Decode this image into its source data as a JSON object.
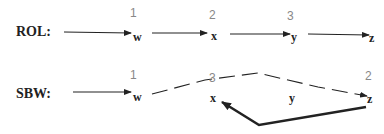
{
  "rows": [
    {
      "label": "ROL:",
      "nodes": [
        "w",
        "x",
        "y",
        "z"
      ],
      "orders": [
        "1",
        "2",
        "3"
      ]
    },
    {
      "label": "SBW:",
      "nodes": [
        "w",
        "x",
        "y",
        "z"
      ],
      "orders": [
        "1",
        "3",
        "2"
      ]
    }
  ],
  "colors": {
    "line": "#222222",
    "order_number": "#888888"
  }
}
